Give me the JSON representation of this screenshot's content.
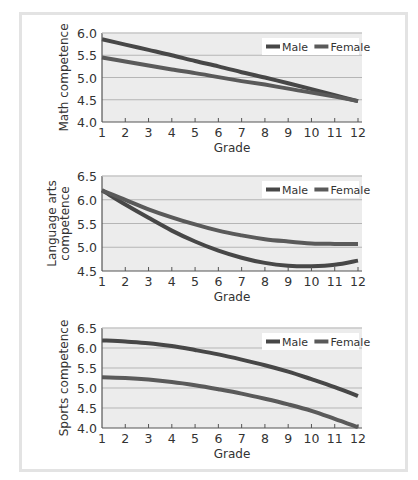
{
  "colors": {
    "plot_bg": "#ececec",
    "grid": "#b5b5b5",
    "axis": "#555555",
    "male": "#474747",
    "female": "#5a5a5a",
    "legend_bg": "#ffffff"
  },
  "chart_data": [
    {
      "type": "line",
      "title": "",
      "xlabel": "Grade",
      "ylabel": "Math  competence",
      "x": [
        1,
        2,
        3,
        4,
        5,
        6,
        7,
        8,
        9,
        10,
        11,
        12
      ],
      "xlim": [
        1,
        12
      ],
      "ylim": [
        4.0,
        6.0
      ],
      "yticks": [
        "4.0",
        "4.5",
        "5.0",
        "5.5",
        "6.0"
      ],
      "grid": true,
      "legend_position": "upper right",
      "series": [
        {
          "name": "Male",
          "values": [
            5.86,
            5.74,
            5.62,
            5.5,
            5.37,
            5.25,
            5.12,
            5.0,
            4.87,
            4.74,
            4.6,
            4.47
          ]
        },
        {
          "name": "Female",
          "values": [
            5.45,
            5.36,
            5.27,
            5.18,
            5.1,
            5.01,
            4.92,
            4.84,
            4.75,
            4.66,
            4.57,
            4.47
          ]
        }
      ]
    },
    {
      "type": "line",
      "title": "",
      "xlabel": "Grade",
      "ylabel": "Language arts competence",
      "ylabel_lines": [
        "Language arts",
        "competence"
      ],
      "x": [
        1,
        2,
        3,
        4,
        5,
        6,
        7,
        8,
        9,
        10,
        11,
        12
      ],
      "xlim": [
        1,
        12
      ],
      "ylim": [
        4.5,
        6.5
      ],
      "yticks": [
        "4.5",
        "5.0",
        "5.5",
        "6.0",
        "6.5"
      ],
      "grid": true,
      "legend_position": "upper right",
      "series": [
        {
          "name": "Male",
          "values": [
            6.2,
            5.9,
            5.62,
            5.35,
            5.12,
            4.93,
            4.78,
            4.67,
            4.61,
            4.6,
            4.63,
            4.72
          ]
        },
        {
          "name": "Female",
          "values": [
            6.2,
            6.0,
            5.8,
            5.63,
            5.48,
            5.35,
            5.25,
            5.17,
            5.12,
            5.08,
            5.07,
            5.07
          ]
        }
      ]
    },
    {
      "type": "line",
      "title": "",
      "xlabel": "Grade",
      "ylabel": "Sports competence",
      "x": [
        1,
        2,
        3,
        4,
        5,
        6,
        7,
        8,
        9,
        10,
        11,
        12
      ],
      "xlim": [
        1,
        12
      ],
      "ylim": [
        4.0,
        6.5
      ],
      "yticks": [
        "4.0",
        "4.5",
        "5.0",
        "5.5",
        "6.0",
        "6.5"
      ],
      "grid": true,
      "legend_position": "upper right",
      "series": [
        {
          "name": "Male",
          "values": [
            6.19,
            6.16,
            6.12,
            6.05,
            5.95,
            5.84,
            5.71,
            5.57,
            5.41,
            5.22,
            5.02,
            4.8
          ]
        },
        {
          "name": "Female",
          "values": [
            5.27,
            5.25,
            5.21,
            5.15,
            5.07,
            4.97,
            4.86,
            4.73,
            4.59,
            4.43,
            4.23,
            4.02
          ]
        }
      ]
    }
  ]
}
